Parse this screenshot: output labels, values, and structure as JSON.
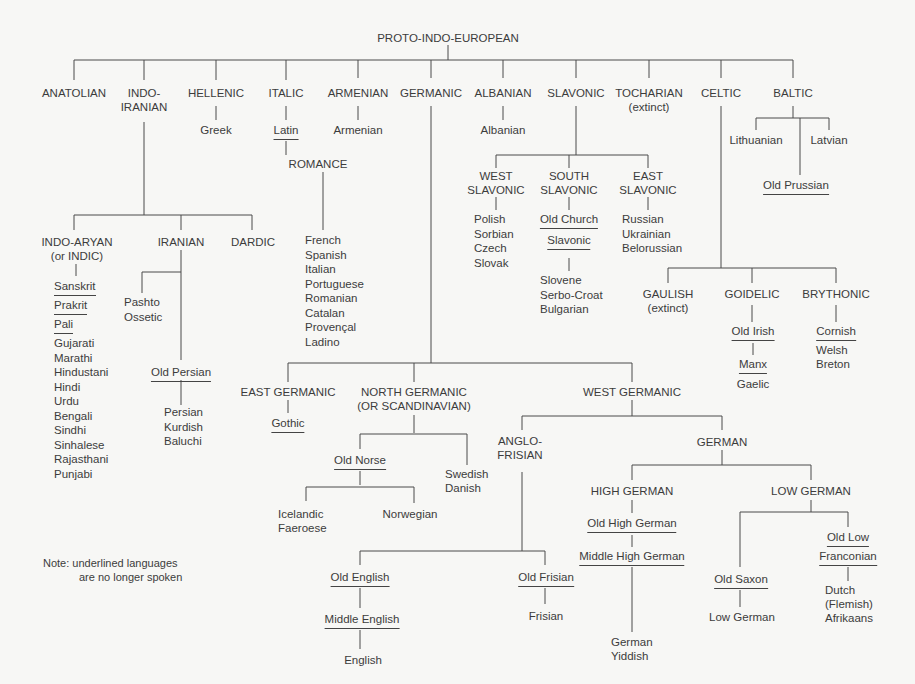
{
  "title": "PROTO-INDO-EUROPEAN",
  "branches": {
    "anatolian": "ANATOLIAN",
    "indo_iranian": [
      "INDO-",
      "IRANIAN"
    ],
    "hellenic": "HELLENIC",
    "italic": "ITALIC",
    "armenian": "ARMENIAN",
    "germanic": "GERMANIC",
    "albanian": "ALBANIAN",
    "slavonic": "SLAVONIC",
    "tocharian": "TOCHARIAN",
    "tocharian_note": "(extinct)",
    "celtic": "CELTIC",
    "baltic": "BALTIC"
  },
  "hellenic": {
    "greek": "Greek"
  },
  "italic": {
    "latin": "Latin",
    "romance": "ROMANCE",
    "romance_languages": [
      "French",
      "Spanish",
      "Italian",
      "Portuguese",
      "Romanian",
      "Catalan",
      "Provençal",
      "Ladino"
    ]
  },
  "armenian": {
    "armenian": "Armenian"
  },
  "albanian": {
    "albanian": "Albanian"
  },
  "indo_iranian": {
    "indo_aryan": [
      "INDO-ARYAN",
      "(or INDIC)"
    ],
    "iranian": "IRANIAN",
    "dardic": "DARDIC",
    "indo_aryan_extinct": [
      "Sanskrit",
      "Prakrit",
      "Pali"
    ],
    "indo_aryan_languages": [
      "Gujarati",
      "Marathi",
      "Hindustani",
      "Hindi",
      "Urdu",
      "Bengali",
      "Sindhi",
      "Sinhalese",
      "Rajasthani",
      "Punjabi"
    ],
    "iranian_languages_a": [
      "Pashto",
      "Ossetic"
    ],
    "old_persian": "Old Persian",
    "iranian_languages_b": [
      "Persian",
      "Kurdish",
      "Baluchi"
    ]
  },
  "slavonic": {
    "west": [
      "WEST",
      "SLAVONIC"
    ],
    "south": [
      "SOUTH",
      "SLAVONIC"
    ],
    "east": [
      "EAST",
      "SLAVONIC"
    ],
    "west_languages": [
      "Polish",
      "Sorbian",
      "Czech",
      "Slovak"
    ],
    "old_church": "Old Church",
    "slavonic_word": "Slavonic",
    "south_languages": [
      "Slovene",
      "Serbo-Croat",
      "Bulgarian"
    ],
    "east_languages": [
      "Russian",
      "Ukrainian",
      "Belorussian"
    ]
  },
  "baltic": {
    "lithuanian": "Lithuanian",
    "latvian": "Latvian",
    "old_prussian": "Old Prussian"
  },
  "celtic": {
    "gaulish": "GAULISH",
    "gaulish_note": "(extinct)",
    "goidelic": "GOIDELIC",
    "brythonic": "BRYTHONIC",
    "old_irish": "Old Irish",
    "manx": "Manx",
    "gaelic": "Gaelic",
    "cornish": "Cornish",
    "welsh": "Welsh",
    "breton": "Breton"
  },
  "germanic": {
    "east": "EAST GERMANIC",
    "gothic": "Gothic",
    "north": [
      "NORTH GERMANIC",
      "(OR SCANDINAVIAN)"
    ],
    "old_norse": "Old Norse",
    "icelandic_faeroese": [
      "Icelandic",
      "Faeroese"
    ],
    "norwegian": "Norwegian",
    "swedish_danish": [
      "Swedish",
      "Danish"
    ],
    "west": "WEST GERMANIC",
    "anglo_frisian": [
      "ANGLO-",
      "FRISIAN"
    ],
    "old_english": "Old English",
    "middle_english": "Middle English",
    "english": "English",
    "old_frisian": "Old Frisian",
    "frisian": "Frisian",
    "german": "GERMAN",
    "high_german": "HIGH GERMAN",
    "old_high_german": "Old High German",
    "middle_high_german": "Middle High German",
    "high_german_languages": [
      "German",
      "Yiddish"
    ],
    "low_german": "LOW GERMAN",
    "old_saxon": "Old Saxon",
    "low_german_lang": "Low German",
    "old_low_franconian": [
      "Old Low",
      "Franconian"
    ],
    "franconian_languages": [
      "Dutch",
      "(Flemish)",
      "Afrikaans"
    ]
  },
  "note": [
    "Note: underlined languages",
    "are no longer spoken"
  ]
}
